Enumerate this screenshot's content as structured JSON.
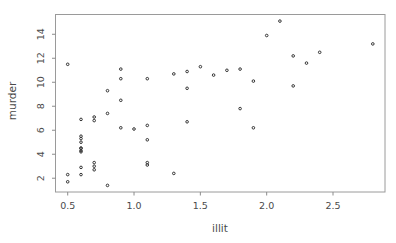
{
  "figure": {
    "background": "#ffffff",
    "frame_color": "#9a9a9a",
    "tick_color": "#8c8c8c",
    "text_color": "#4a4a4a",
    "point_color": "#333333"
  },
  "chart_data": {
    "type": "scatter",
    "title": "",
    "xlabel": "illit",
    "ylabel": "murder",
    "xlim": [
      0.408,
      2.892
    ],
    "ylim": [
      0.852,
      15.648
    ],
    "grid": false,
    "legend": null,
    "point_style": "open-circle",
    "x_ticks": [
      0.5,
      1.0,
      1.5,
      2.0,
      2.5
    ],
    "x_tick_labels": [
      "0.5",
      "1.0",
      "1.5",
      "2.0",
      "2.5"
    ],
    "y_ticks": [
      2,
      4,
      6,
      8,
      10,
      12,
      14
    ],
    "y_tick_labels": [
      "2",
      "4",
      "6",
      "8",
      "10",
      "12",
      "14"
    ],
    "points": [
      [
        2.1,
        15.1
      ],
      [
        1.5,
        11.3
      ],
      [
        1.8,
        7.8
      ],
      [
        1.9,
        10.1
      ],
      [
        1.1,
        10.3
      ],
      [
        0.7,
        6.8
      ],
      [
        1.1,
        3.1
      ],
      [
        0.9,
        6.2
      ],
      [
        1.3,
        10.7
      ],
      [
        2.0,
        13.9
      ],
      [
        1.9,
        6.2
      ],
      [
        0.6,
        5.3
      ],
      [
        0.9,
        10.3
      ],
      [
        0.7,
        7.1
      ],
      [
        0.5,
        2.3
      ],
      [
        0.6,
        4.5
      ],
      [
        1.6,
        10.6
      ],
      [
        2.8,
        13.2
      ],
      [
        0.7,
        2.7
      ],
      [
        0.9,
        8.5
      ],
      [
        1.1,
        3.3
      ],
      [
        0.9,
        11.1
      ],
      [
        0.6,
        2.3
      ],
      [
        2.4,
        12.5
      ],
      [
        0.8,
        9.3
      ],
      [
        0.6,
        5.0
      ],
      [
        0.6,
        2.9
      ],
      [
        0.5,
        11.5
      ],
      [
        0.7,
        3.3
      ],
      [
        1.1,
        5.2
      ],
      [
        2.2,
        9.7
      ],
      [
        1.4,
        10.9
      ],
      [
        1.8,
        11.1
      ],
      [
        0.8,
        1.4
      ],
      [
        0.8,
        7.4
      ],
      [
        1.1,
        6.4
      ],
      [
        0.6,
        4.2
      ],
      [
        1.0,
        6.1
      ],
      [
        1.3,
        2.4
      ],
      [
        2.3,
        11.6
      ],
      [
        0.5,
        1.7
      ],
      [
        1.7,
        11.0
      ],
      [
        2.2,
        12.2
      ],
      [
        0.6,
        4.5
      ],
      [
        0.6,
        5.5
      ],
      [
        1.4,
        9.5
      ],
      [
        0.6,
        4.3
      ],
      [
        1.4,
        6.7
      ],
      [
        0.7,
        3.0
      ],
      [
        0.6,
        6.9
      ]
    ]
  }
}
